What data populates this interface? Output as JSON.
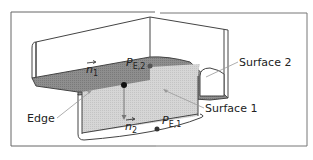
{
  "diagram": {
    "colors": {
      "frame": "#555555",
      "outline": "#444444",
      "surface2_fill": "#8c8c8c",
      "surface1_fill": "#d9d9d9",
      "point": "#333333",
      "leader": "#9a9a9a"
    },
    "labels": {
      "n1": "n",
      "n1_sub": "1",
      "n2": "n",
      "n2_sub": "2",
      "pe2": "P",
      "pe2_sub": "E,2",
      "pe1": "P",
      "pe1_sub": "E,1",
      "surface2": "Surface 2",
      "surface1": "Surface 1",
      "edge": "Edge"
    }
  }
}
